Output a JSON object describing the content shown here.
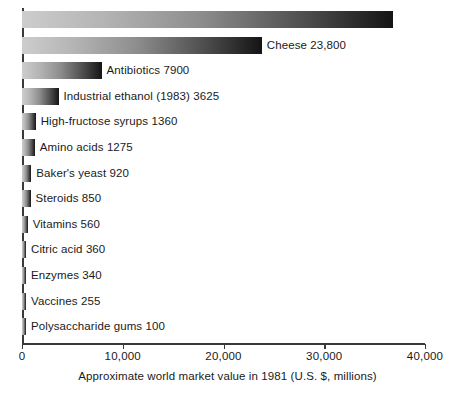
{
  "chart_data": {
    "type": "bar",
    "orientation": "horizontal",
    "title": "",
    "xlabel": "Approximate world market value in 1981 (U.S. $, millions)",
    "ylabel": "",
    "xlim": [
      0,
      40000
    ],
    "grid": false,
    "legend": null,
    "xticks": [
      0,
      10000,
      20000,
      30000,
      40000
    ],
    "xticklabels": [
      "0",
      "10,000",
      "20,000",
      "30,000",
      "40,000"
    ],
    "categories": [
      "Alcoholic beverages",
      "Cheese",
      "Antibiotics",
      "Industrial ethanol (1983)",
      "High-fructose syrups",
      "Amino acids",
      "Baker's yeast",
      "Steroids",
      "Vitamins",
      "Citric acid",
      "Enzymes",
      "Vaccines",
      "Polysaccharide gums"
    ],
    "values": [
      36800,
      23800,
      7900,
      3625,
      1360,
      1275,
      920,
      850,
      560,
      360,
      340,
      255,
      100
    ],
    "value_labels": [
      "36,800",
      "23,800",
      "7900",
      "3625",
      "1360",
      "1275",
      "920",
      "850",
      "560",
      "360",
      "340",
      "255",
      "100"
    ],
    "bars": [
      {
        "category": "Alcoholic beverages",
        "value": 36800,
        "value_label": "36,800",
        "label": "Alcoholic beverages  36,800",
        "label_position": "inside"
      },
      {
        "category": "Cheese",
        "value": 23800,
        "value_label": "23,800",
        "label": "Cheese  23,800",
        "label_position": "outside"
      },
      {
        "category": "Antibiotics",
        "value": 7900,
        "value_label": "7900",
        "label": "Antibiotics  7900",
        "label_position": "outside"
      },
      {
        "category": "Industrial ethanol (1983)",
        "value": 3625,
        "value_label": "3625",
        "label": "Industrial ethanol (1983)  3625",
        "label_position": "outside"
      },
      {
        "category": "High-fructose syrups",
        "value": 1360,
        "value_label": "1360",
        "label": "High-fructose syrups  1360",
        "label_position": "outside"
      },
      {
        "category": "Amino acids",
        "value": 1275,
        "value_label": "1275",
        "label": "Amino acids  1275",
        "label_position": "outside"
      },
      {
        "category": "Baker's yeast",
        "value": 920,
        "value_label": "920",
        "label": "Baker's yeast  920",
        "label_position": "outside"
      },
      {
        "category": "Steroids",
        "value": 850,
        "value_label": "850",
        "label": "Steroids  850",
        "label_position": "outside"
      },
      {
        "category": "Vitamins",
        "value": 560,
        "value_label": "560",
        "label": "Vitamins  560",
        "label_position": "outside"
      },
      {
        "category": "Citric acid",
        "value": 360,
        "value_label": "360",
        "label": "Citric acid  360",
        "label_position": "outside"
      },
      {
        "category": "Enzymes",
        "value": 340,
        "value_label": "340",
        "label": "Enzymes  340",
        "label_position": "outside"
      },
      {
        "category": "Vaccines",
        "value": 255,
        "value_label": "255",
        "label": "Vaccines  255",
        "label_position": "outside"
      },
      {
        "category": "Polysaccharide gums",
        "value": 100,
        "value_label": "100",
        "label": "Polysaccharide gums  100",
        "label_position": "outside"
      }
    ],
    "colors": {
      "bar_gradient_start": "#cdcdcd",
      "bar_gradient_end": "#141414",
      "axis": "#3a3a3a",
      "text": "#1a1a1a",
      "inside_label_text": "#ffffff",
      "background": "#ffffff"
    }
  }
}
